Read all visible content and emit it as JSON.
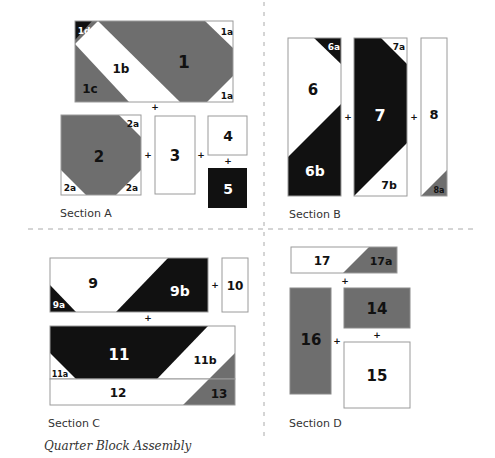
{
  "title": "Quarter Block Assembly",
  "colors": {
    "dark": "#111111",
    "gray": "#6e6e6e",
    "light": "#ffffff",
    "stroke": "#9a9a9a",
    "divider": "#aaaaaa"
  },
  "sections": [
    {
      "id": "A",
      "label": "Section A"
    },
    {
      "id": "B",
      "label": "Section B"
    },
    {
      "id": "C",
      "label": "Section C"
    },
    {
      "id": "D",
      "label": "Section D"
    }
  ],
  "pieces": {
    "p1": "1",
    "p1a_top": "1a",
    "p1a_bot": "1a",
    "p1b": "1b",
    "p1c": "1c",
    "p1d": "1d",
    "p2": "2",
    "p2a_tr": "2a",
    "p2a_bl": "2a",
    "p2a_br": "2a",
    "p3": "3",
    "p4": "4",
    "p5": "5",
    "p6": "6",
    "p6a": "6a",
    "p6b": "6b",
    "p7": "7",
    "p7a": "7a",
    "p7b": "7b",
    "p8": "8",
    "p8a": "8a",
    "p9": "9",
    "p9a": "9a",
    "p9b": "9b",
    "p10": "10",
    "p11": "11",
    "p11a": "11a",
    "p11b": "11b",
    "p12": "12",
    "p13": "13",
    "p14": "14",
    "p15": "15",
    "p16": "16",
    "p17": "17",
    "p17a": "17a"
  },
  "join_symbol": "+"
}
